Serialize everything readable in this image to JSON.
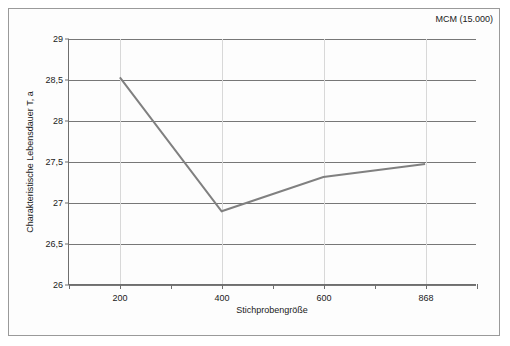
{
  "annotation": {
    "text": "MCM (15.000)"
  },
  "axes": {
    "y_title": "Charakteristische Lebensdauer T, a",
    "x_title": "Stichprobengröße",
    "y_ticks": [
      "29",
      "28,5",
      "28",
      "27,5",
      "27",
      "26,5",
      "26"
    ],
    "x_ticks": [
      "200",
      "400",
      "600",
      "868"
    ]
  },
  "style": {
    "line_color": "#808080",
    "grid_color": "#777777",
    "vgrid_color": "#d8d8d8",
    "frame_color": "#9a9a9a",
    "text_color": "#1a1a1a",
    "background": "#fdfdfd"
  },
  "chart_data": {
    "type": "line",
    "title": "",
    "xlabel": "Stichprobengröße",
    "ylabel": "Charakteristische Lebensdauer T, a",
    "categories": [
      "200",
      "400",
      "600",
      "868"
    ],
    "values": [
      28.53,
      26.89,
      27.31,
      27.47
    ],
    "series": [
      {
        "name": "MCM (15.000)",
        "values": [
          28.53,
          26.89,
          27.31,
          27.47
        ]
      }
    ],
    "ylim": [
      26,
      29
    ],
    "ytick_values": [
      29,
      28.5,
      28,
      27.5,
      27,
      26.5,
      26
    ],
    "ytick_labels": [
      "29",
      "28,5",
      "28",
      "27,5",
      "27",
      "26,5",
      "26"
    ],
    "xtick_labels": [
      "200",
      "400",
      "600",
      "868"
    ],
    "grid": "horizontal-major-and-vertical-minor",
    "legend": "none",
    "annotations": [
      "MCM (15.000)"
    ],
    "markers": false
  }
}
